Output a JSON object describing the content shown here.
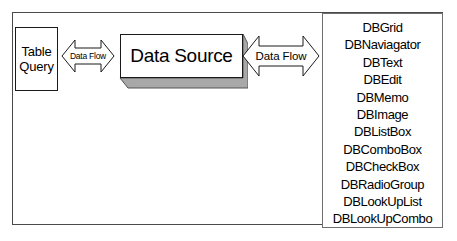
{
  "diagram": {
    "background_color": "#ffffff",
    "frame": {
      "name": "outer-frame",
      "border_color": "#4a4a4a"
    },
    "source_box": {
      "lines": [
        "Table",
        "Query"
      ],
      "border_color": "#1a1a1a",
      "fill_color": "#ffffff"
    },
    "data_source_box": {
      "label": "Data Source",
      "border_color": "#1a1a1a",
      "fill_color": "#ffffff",
      "shadow_color": "#a8a8a8"
    },
    "arrows": [
      {
        "id": "left",
        "label": "Data Flow",
        "direction": "bidirectional",
        "stroke_color": "#1a1a1a",
        "fill_color": "#ffffff"
      },
      {
        "id": "right",
        "label": "Data Flow",
        "direction": "bidirectional",
        "stroke_color": "#1a1a1a",
        "fill_color": "#ffffff"
      }
    ],
    "component_list": {
      "border_color": "#6e6e6e",
      "items": [
        "DBGrid",
        "DBNaviagator",
        "DBText",
        "DBEdit",
        "DBMemo",
        "DBImage",
        "DBListBox",
        "DBComboBox",
        "DBCheckBox",
        "DBRadioGroup",
        "DBLookUpList",
        "DBLookUpCombo"
      ]
    }
  }
}
